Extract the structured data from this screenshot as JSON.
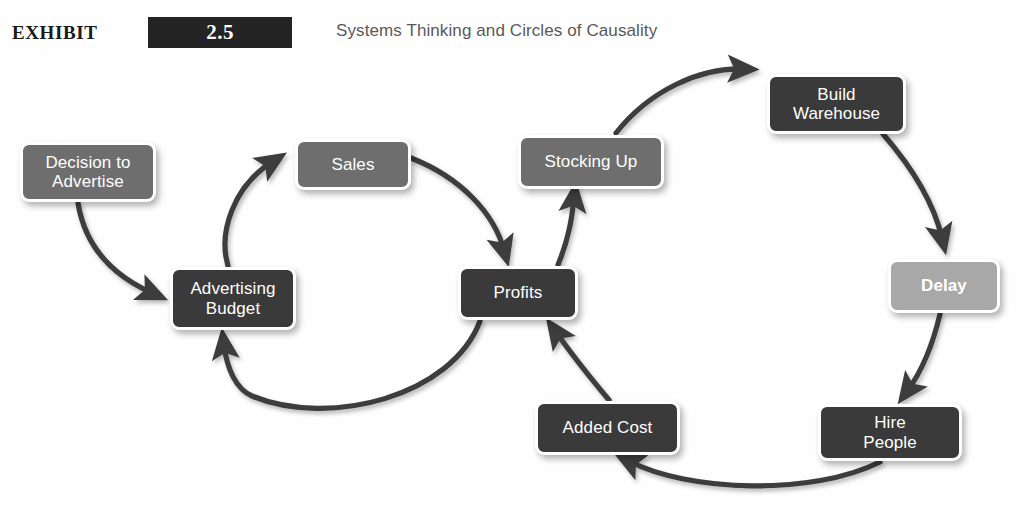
{
  "header": {
    "exhibit_label": "EXHIBIT",
    "exhibit_number": "2.5",
    "title": "Systems Thinking and Circles of Causality"
  },
  "diagram": {
    "type": "causal-loop-diagram",
    "nodes": [
      {
        "id": "decision-to-advertise",
        "label": "Decision to\nAdvertise",
        "tone": "mid",
        "x": 20,
        "y": 142,
        "w": 136,
        "h": 60
      },
      {
        "id": "advertising-budget",
        "label": "Advertising\nBudget",
        "tone": "dark",
        "x": 170,
        "y": 267,
        "w": 126,
        "h": 63
      },
      {
        "id": "sales",
        "label": "Sales",
        "tone": "mid",
        "x": 295,
        "y": 139,
        "w": 116,
        "h": 51
      },
      {
        "id": "profits",
        "label": "Profits",
        "tone": "dark",
        "x": 458,
        "y": 266,
        "w": 120,
        "h": 54
      },
      {
        "id": "stocking-up",
        "label": "Stocking Up",
        "tone": "mid",
        "x": 518,
        "y": 135,
        "w": 146,
        "h": 54
      },
      {
        "id": "build-warehouse",
        "label": "Build\nWarehouse",
        "tone": "dark",
        "x": 767,
        "y": 74,
        "w": 139,
        "h": 60
      },
      {
        "id": "delay",
        "label": "Delay",
        "tone": "light",
        "x": 888,
        "y": 259,
        "w": 112,
        "h": 54
      },
      {
        "id": "hire-people",
        "label": "Hire\nPeople",
        "tone": "dark",
        "x": 818,
        "y": 404,
        "w": 144,
        "h": 57
      },
      {
        "id": "added-cost",
        "label": "Added Cost",
        "tone": "dark",
        "x": 535,
        "y": 401,
        "w": 145,
        "h": 54
      }
    ],
    "edges": [
      {
        "from": "decision-to-advertise",
        "to": "advertising-budget"
      },
      {
        "from": "advertising-budget",
        "to": "sales"
      },
      {
        "from": "sales",
        "to": "profits"
      },
      {
        "from": "profits",
        "to": "advertising-budget"
      },
      {
        "from": "profits",
        "to": "stocking-up"
      },
      {
        "from": "stocking-up",
        "to": "build-warehouse"
      },
      {
        "from": "build-warehouse",
        "to": "delay"
      },
      {
        "from": "delay",
        "to": "hire-people"
      },
      {
        "from": "hire-people",
        "to": "added-cost"
      },
      {
        "from": "added-cost",
        "to": "profits"
      }
    ],
    "colors": {
      "node_dark": "#3a3a3a",
      "node_mid": "#6e6e6e",
      "node_light": "#a8a8a8",
      "arrow": "#3c3c3c",
      "node_border": "#ffffff",
      "label_text": "#ffffff",
      "background": "#fefefe",
      "header_box": "#242424",
      "header_title": "#59595b"
    }
  }
}
